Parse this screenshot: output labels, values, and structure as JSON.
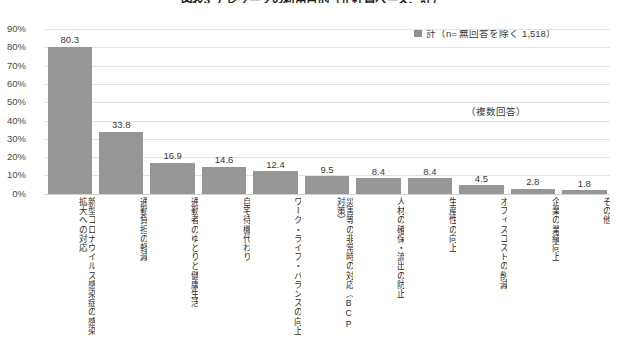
{
  "chart_data": {
    "type": "bar",
    "title": "図表3 テレワークの利用目的（正社員ベース、計）",
    "subtitle": "",
    "categories": [
      "新型コロナウイルス感染症の感染拡大への対応",
      "通勤負担の軽減",
      "通勤者のゆとりと健康生活",
      "自宅待機代わり",
      "ワーク・ライフ・バランスの向上",
      "災害等の非常時の対応（BCP対策）",
      "人材の確保・流出の防止",
      "生産性の向上",
      "オフィスコストの削減",
      "企業の業績向上",
      "その他"
    ],
    "values": [
      80.3,
      33.8,
      16.9,
      14.6,
      12.4,
      9.5,
      8.4,
      8.4,
      4.5,
      2.8,
      1.8
    ],
    "series": [
      {
        "name": "計（n= 無回答を除く 1,518）",
        "values": [
          80.3,
          33.8,
          16.9,
          14.6,
          12.4,
          9.5,
          8.4,
          8.4,
          4.5,
          2.8,
          1.8
        ]
      }
    ],
    "xlabel": "",
    "ylabel": "",
    "ylim": [
      0,
      90
    ],
    "ytick_labels": [
      "90%",
      "80%",
      "70%",
      "60%",
      "50%",
      "40%",
      "30%",
      "20%",
      "10%",
      "0%"
    ],
    "ytick_values": [
      90,
      80,
      70,
      60,
      50,
      40,
      30,
      20,
      10,
      0
    ],
    "grid": true,
    "legend_position": "top-right",
    "annotations": [
      "（複数回答）"
    ],
    "bar_color": "#969696",
    "grid_color": "#e2e2e2"
  },
  "legend": {
    "entries": [
      {
        "label": "計（n= 無回答を除く 1,518）",
        "color": "#8f8f8f"
      }
    ]
  },
  "annotation": {
    "multiple_answers": "（複数回答）"
  }
}
